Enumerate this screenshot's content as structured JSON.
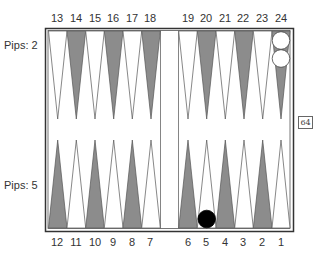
{
  "pips": {
    "top": "Pips: 2",
    "bottom": "Pips: 5"
  },
  "points": {
    "top_left": [
      "13",
      "14",
      "15",
      "16",
      "17",
      "18"
    ],
    "top_right": [
      "19",
      "20",
      "21",
      "22",
      "23",
      "24"
    ],
    "bottom_left": [
      "12",
      "11",
      "10",
      "9",
      "8",
      "7"
    ],
    "bottom_right": [
      "6",
      "5",
      "4",
      "3",
      "2",
      "1"
    ]
  },
  "checkers": [
    {
      "color": "white",
      "point": "24",
      "count": 2
    },
    {
      "color": "black",
      "point": "5",
      "count": 1
    }
  ],
  "doubling_cube": {
    "value": "64"
  },
  "colors": {
    "dark_point": "#8c8c8c",
    "light_point": "#ffffff",
    "frame": "#333333",
    "black_checker": "#000000",
    "white_checker": "#ffffff"
  }
}
